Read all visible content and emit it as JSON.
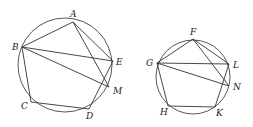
{
  "figures": [
    {
      "name": "left-figure",
      "circle": {
        "cx": 65,
        "cy": 65,
        "r": 47
      },
      "points": {
        "A": {
          "x": 73,
          "y": 22,
          "lx": 70,
          "ly": 17
        },
        "B": {
          "x": 22,
          "y": 47,
          "lx": 12,
          "ly": 50
        },
        "E": {
          "x": 113,
          "y": 61,
          "lx": 116,
          "ly": 65
        },
        "M": {
          "x": 109,
          "y": 87,
          "lx": 113,
          "ly": 94
        },
        "C": {
          "x": 31,
          "y": 102,
          "lx": 21,
          "ly": 109
        },
        "D": {
          "x": 89,
          "y": 109,
          "lx": 86,
          "ly": 119
        }
      },
      "segments": [
        [
          "A",
          "B"
        ],
        [
          "B",
          "C"
        ],
        [
          "C",
          "D"
        ],
        [
          "D",
          "E"
        ],
        [
          "E",
          "A"
        ],
        [
          "B",
          "E"
        ],
        [
          "B",
          "M"
        ],
        [
          "A",
          "M"
        ]
      ]
    },
    {
      "name": "right-figure",
      "circle": {
        "cx": 193,
        "cy": 77,
        "r": 37
      },
      "points": {
        "F": {
          "x": 193,
          "y": 39,
          "lx": 190,
          "ly": 35
        },
        "G": {
          "x": 157,
          "y": 63,
          "lx": 146,
          "ly": 66
        },
        "L": {
          "x": 229,
          "y": 64,
          "lx": 233,
          "ly": 68
        },
        "N": {
          "x": 229,
          "y": 86,
          "lx": 233,
          "ly": 90
        },
        "H": {
          "x": 168,
          "y": 106,
          "lx": 160,
          "ly": 115
        },
        "K": {
          "x": 215,
          "y": 107,
          "lx": 216,
          "ly": 116
        }
      },
      "segments": [
        [
          "F",
          "G"
        ],
        [
          "G",
          "H"
        ],
        [
          "H",
          "K"
        ],
        [
          "K",
          "L"
        ],
        [
          "L",
          "F"
        ],
        [
          "G",
          "L"
        ],
        [
          "G",
          "N"
        ],
        [
          "F",
          "N"
        ]
      ]
    }
  ]
}
